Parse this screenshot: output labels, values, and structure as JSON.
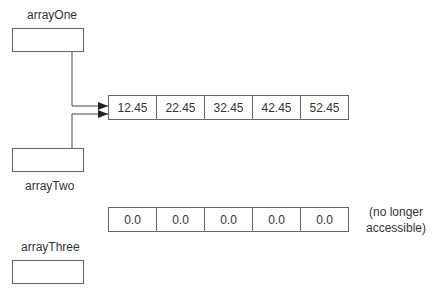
{
  "variables": [
    {
      "name": "arrayOne"
    },
    {
      "name": "arrayTwo"
    },
    {
      "name": "arrayThree"
    }
  ],
  "arrays": {
    "active": {
      "values": [
        "12.45",
        "22.45",
        "32.45",
        "42.45",
        "52.45"
      ]
    },
    "orphaned": {
      "values": [
        "0.0",
        "0.0",
        "0.0",
        "0.0",
        "0.0"
      ],
      "note_line1": "(no longer",
      "note_line2": "accessible)"
    }
  }
}
